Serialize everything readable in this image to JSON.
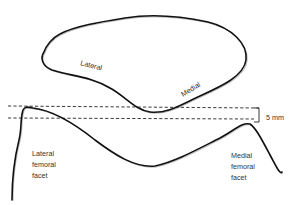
{
  "diagram": {
    "patella_labels": {
      "lateral": "Lateral",
      "medial": "Medial"
    },
    "measurement_label": "5 mm",
    "facet_labels": {
      "lateral": [
        "Lateral",
        "femoral",
        "facet"
      ],
      "medial": [
        "Medial",
        "femoral",
        "facet"
      ]
    }
  }
}
